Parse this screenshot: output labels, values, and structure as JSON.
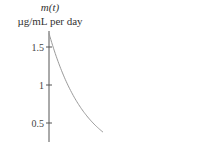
{
  "chart_data": {
    "type": "line",
    "title": "m(t)",
    "xlabel": "",
    "ylabel": "µg/mL per day",
    "ylim": [
      0.25,
      1.72
    ],
    "y_ticks": [
      {
        "value": 1.5,
        "label": "1.5"
      },
      {
        "value": 1,
        "label": "1"
      },
      {
        "value": 0.5,
        "label": "0.5"
      }
    ],
    "series": [
      {
        "name": "m(t)",
        "color": "#9a9a9a",
        "x": [
          0,
          0.1,
          0.2,
          0.3,
          0.4,
          0.5,
          0.6,
          0.7,
          0.8,
          0.9,
          1.0
        ],
        "values": [
          1.68,
          1.45,
          1.25,
          1.08,
          0.93,
          0.8,
          0.69,
          0.59,
          0.51,
          0.44,
          0.38
        ]
      }
    ],
    "xlim": [
      0,
      1.0
    ],
    "grid": false
  }
}
